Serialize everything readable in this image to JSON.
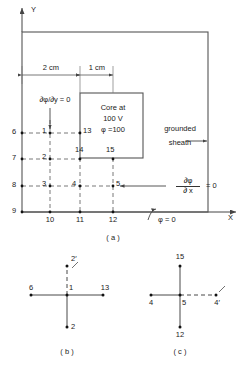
{
  "figure": {
    "axes": {
      "y_label": "Y",
      "x_label": "X"
    },
    "dimensions": [
      {
        "id": "dim_2cm",
        "label": "2 cm"
      },
      {
        "id": "dim_1cm",
        "label": "1 cm"
      }
    ],
    "annotations": {
      "neumann_y": "∂φ/∂y = 0",
      "core_line1": "Core at",
      "core_line2": "100 V",
      "core_line3": "φ =100",
      "sheath_line1": "grounded",
      "sheath_line2": "sheath",
      "neumann_x_num": "∂φ",
      "neumann_x_den": "∂ x",
      "neumann_x_eq": "= 0",
      "dirichlet": "φ = 0"
    },
    "nodes_a": [
      {
        "id": "n6",
        "label": "6"
      },
      {
        "id": "n1",
        "label": "1"
      },
      {
        "id": "n13",
        "label": "13"
      },
      {
        "id": "n7",
        "label": "7"
      },
      {
        "id": "n2",
        "label": "2"
      },
      {
        "id": "n14",
        "label": "14"
      },
      {
        "id": "n15",
        "label": "15"
      },
      {
        "id": "n8",
        "label": "8"
      },
      {
        "id": "n3",
        "label": "3"
      },
      {
        "id": "n4",
        "label": "4"
      },
      {
        "id": "n5",
        "label": "5"
      },
      {
        "id": "n9",
        "label": "9"
      },
      {
        "id": "n10",
        "label": "10"
      },
      {
        "id": "n11",
        "label": "11"
      },
      {
        "id": "n12",
        "label": "12"
      }
    ],
    "captions": {
      "a": "( a )",
      "b": "( b )",
      "c": "( c )"
    },
    "stencil_b": {
      "center": "1",
      "top": "2′",
      "left": "6",
      "right": "13",
      "bottom": "2"
    },
    "stencil_c": {
      "center": "5",
      "top": "15",
      "left": "4",
      "right": "4′",
      "bottom": "12"
    }
  }
}
